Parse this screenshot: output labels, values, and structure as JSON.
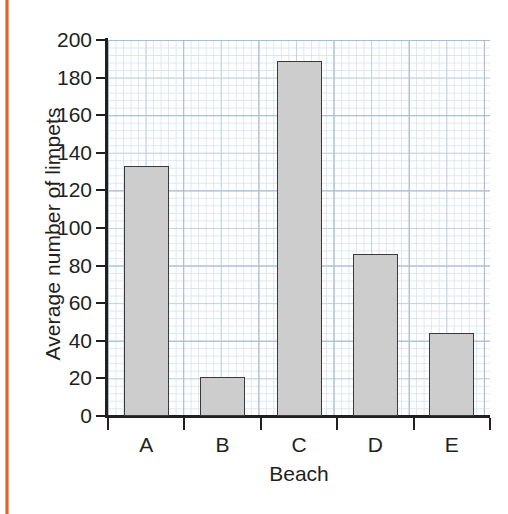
{
  "figure": {
    "kind": "bar-chart-graph-paper",
    "page_rule_color": "#e2662c",
    "bar_fill_color": "#cdcdcd",
    "bar_edge_color": "#3a3a3a",
    "grid_color": "#a8bdd4",
    "axis_color": "#231f20"
  },
  "chart_data": {
    "type": "bar",
    "title": "",
    "xlabel": "Beach",
    "ylabel": "Average number of limpets",
    "categories": [
      "A",
      "B",
      "C",
      "D",
      "E"
    ],
    "values": [
      133,
      21,
      189,
      86,
      44
    ],
    "ylim": [
      0,
      200
    ],
    "ytick_labels": [
      "200",
      "180",
      "160",
      "140",
      "120",
      "100",
      "80",
      "60",
      "40",
      "20",
      "0"
    ],
    "ytick_values": [
      200,
      180,
      160,
      140,
      120,
      100,
      80,
      60,
      40,
      20,
      0
    ],
    "ytick_step": 20,
    "grid": true,
    "grid_style": "graph-paper",
    "legend": null
  }
}
